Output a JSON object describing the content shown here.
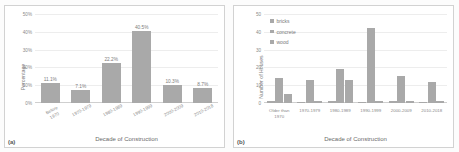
{
  "figure": {
    "panels": [
      {
        "tag": "(a)",
        "chart_data": {
          "type": "bar",
          "title": "",
          "xlabel": "Decade of Construction",
          "ylabel": "Percentage",
          "categories": [
            "Before\n1970",
            "1970-1979",
            "1980-1989",
            "1990-1999",
            "2000-2009",
            "2010-2018"
          ],
          "values": [
            11.1,
            7.1,
            22.2,
            40.5,
            10.3,
            8.7
          ],
          "data_labels": [
            "11.1%",
            "7.1%",
            "22.2%",
            "40.5%",
            "10.3%",
            "8.7%"
          ],
          "ylim": [
            0,
            50
          ],
          "yticks": [
            "0%",
            "10%",
            "20%",
            "30%",
            "40%",
            "50%"
          ],
          "grid": true,
          "legend": "none",
          "bar_color": "#a9a9a9"
        }
      },
      {
        "tag": "(b)",
        "chart_data": {
          "type": "bar",
          "title": "",
          "xlabel": "Decade of Construction",
          "ylabel": "Number of Houses",
          "categories": [
            "Older than\n1970",
            "1970-1979",
            "1980-1989",
            "1990-1999",
            "2000-2009",
            "2010-2018"
          ],
          "series": [
            {
              "name": "bricks",
              "values": [
                1,
                0,
                1,
                0,
                1,
                0
              ]
            },
            {
              "name": "concrete",
              "values": [
                14,
                13,
                19,
                42,
                15,
                12
              ]
            },
            {
              "name": "wood",
              "values": [
                5,
                1,
                13,
                1,
                1,
                1
              ]
            }
          ],
          "extra_series_note": "",
          "ylim": [
            0,
            50
          ],
          "yticks": [
            "0",
            "10",
            "20",
            "30",
            "40",
            "50"
          ],
          "grid": true,
          "legend": "top-left",
          "bar_color": "#a9a9a9"
        }
      }
    ]
  }
}
